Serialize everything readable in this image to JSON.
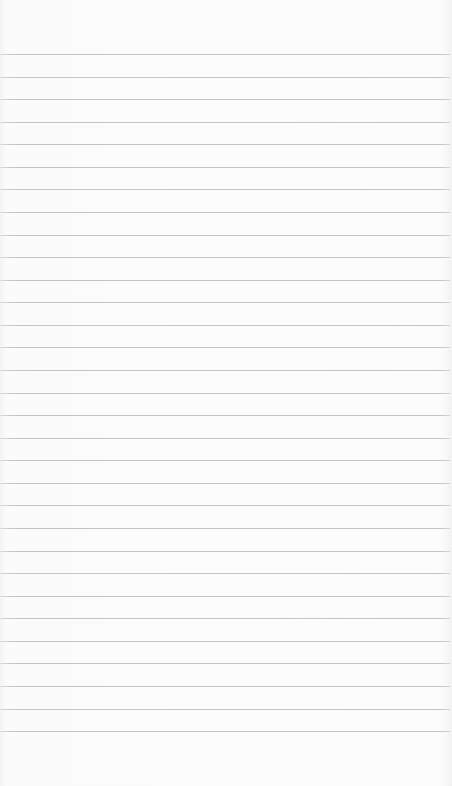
{
  "page": {
    "type": "ruled-paper",
    "background_color": "#fafafa",
    "line_color": "#c4c4c4",
    "line_count": 31,
    "first_line_y": 54,
    "line_spacing": 22.57
  }
}
